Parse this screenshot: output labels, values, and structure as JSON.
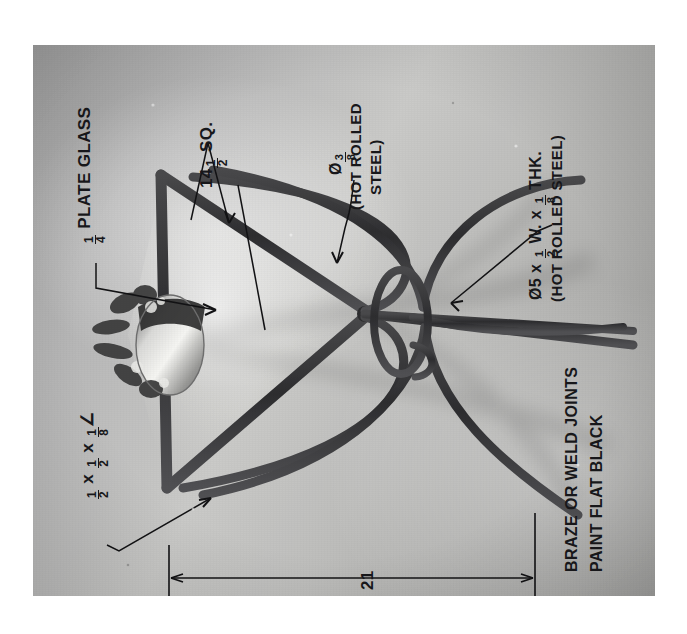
{
  "document": {
    "kind": "engineering-photo-annotation",
    "orientation": "text rotated 90 degrees counter-clockwise",
    "subject": "metal plant stand / glass top table with potted plant"
  },
  "photo": {
    "background_color": "#b6b6b6",
    "metal_color": "#3a3a3c",
    "left": 33,
    "top": 45,
    "width": 622,
    "height": 551
  },
  "annotations": {
    "plate_glass": {
      "name": "plate-glass-callout",
      "fraction": {
        "num": "1",
        "den": "4"
      },
      "text": " PLATE GLASS"
    },
    "square_dim": {
      "name": "square-dimension-callout",
      "whole": "14",
      "fraction": {
        "num": "1",
        "den": "2"
      },
      "text": " SQ."
    },
    "rod_dia": {
      "name": "rod-diameter-callout",
      "symbol": "Ø",
      "fraction": {
        "num": "3",
        "den": "8"
      },
      "line2": "(HOT ROLLED",
      "line3": "STEEL)"
    },
    "ring_spec": {
      "name": "ring-specification-callout",
      "prefix": "Ø5 x ",
      "frac1": {
        "num": "1",
        "den": "2"
      },
      "mid": " W. x ",
      "frac2": {
        "num": "1",
        "den": "8"
      },
      "suffix": " THK.",
      "line2": "(HOT ROLLED STEEL)"
    },
    "angle_iron": {
      "name": "angle-iron-callout",
      "frac1": {
        "num": "1",
        "den": "2"
      },
      "x1": " x ",
      "frac2": {
        "num": "1",
        "den": "2"
      },
      "x2": " x ",
      "frac3": {
        "num": "1",
        "den": "8"
      },
      "angle_symbol": "∠"
    },
    "notes": {
      "name": "fabrication-notes",
      "line1": "BRAZE OR WELD JOINTS",
      "line2": "PAINT FLAT BLACK"
    },
    "overall_height": {
      "name": "overall-height-dimension",
      "value": "21"
    }
  }
}
